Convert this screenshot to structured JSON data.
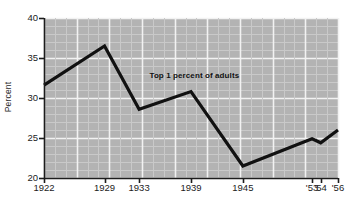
{
  "chart_data": {
    "type": "line",
    "title": "",
    "subtitle": "",
    "xlabel": "",
    "ylabel": "Percent",
    "xlim": [
      1922,
      1956
    ],
    "ylim": [
      20,
      40
    ],
    "yticks": [
      20,
      25,
      30,
      35,
      40
    ],
    "ytick_labels": [
      "20",
      "25",
      "30",
      "35",
      "40"
    ],
    "xticks": [
      1922,
      1929,
      1933,
      1939,
      1945,
      1953,
      1954,
      1956
    ],
    "xtick_labels": [
      "1922",
      "1929",
      "1933",
      "1939",
      "1945",
      "'53",
      "'54",
      "'56"
    ],
    "grid": true,
    "grid_major_step_y": 5,
    "grid_minor_step_y": 1,
    "legend": "none",
    "annotations": [
      {
        "text": "Top 1 percent of adults",
        "x": 1934.2,
        "y": 32.6
      }
    ],
    "series": [
      {
        "name": "Top 1 percent of adults",
        "x": [
          1922,
          1929,
          1933,
          1939,
          1945,
          1953,
          1954,
          1956
        ],
        "values": [
          31.6,
          36.5,
          28.6,
          30.8,
          21.5,
          24.9,
          24.4,
          26.0
        ]
      }
    ],
    "colors": {
      "plot_background": "#b3b3b3",
      "grid_major": "#f2f2f2",
      "grid_minor": "#c9c9c9",
      "line": "#111111",
      "axis": "#1c1c1c",
      "text": "#1c1c1c",
      "page_background": "#ffffff"
    },
    "geometry": {
      "plot_left": 44,
      "plot_right": 338,
      "plot_top": 18,
      "plot_bottom": 178
    }
  }
}
